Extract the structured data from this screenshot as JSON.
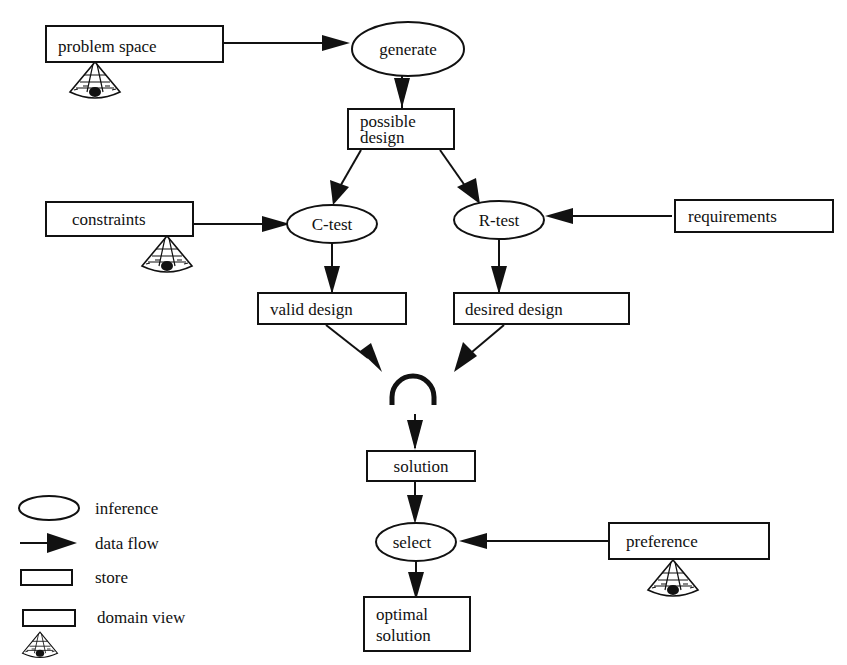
{
  "diagram": {
    "nodes": {
      "problem_space": {
        "label": "problem space",
        "type": "domain view"
      },
      "generate": {
        "label": "generate",
        "type": "inference"
      },
      "possible_design": {
        "line1": "possible",
        "line2": "design",
        "type": "store"
      },
      "constraints": {
        "label": "constraints",
        "type": "domain view"
      },
      "c_test": {
        "label": "C-test",
        "type": "inference"
      },
      "r_test": {
        "label": "R-test",
        "type": "inference"
      },
      "requirements": {
        "label": "requirements",
        "type": "store"
      },
      "valid_design": {
        "label": "valid design",
        "type": "store"
      },
      "desired_design": {
        "label": "desired design",
        "type": "store"
      },
      "intersection": {
        "symbol": "∩",
        "type": "operator"
      },
      "solution": {
        "label": "solution",
        "type": "store"
      },
      "select": {
        "label": "select",
        "type": "inference"
      },
      "preference": {
        "label": "preference",
        "type": "domain view"
      },
      "optimal_solution": {
        "line1": "optimal",
        "line2": "solution",
        "type": "store"
      }
    },
    "edges": [
      {
        "from": "problem space",
        "to": "generate"
      },
      {
        "from": "generate",
        "to": "possible design"
      },
      {
        "from": "possible design",
        "to": "C-test"
      },
      {
        "from": "possible design",
        "to": "R-test"
      },
      {
        "from": "constraints",
        "to": "C-test"
      },
      {
        "from": "requirements",
        "to": "R-test"
      },
      {
        "from": "C-test",
        "to": "valid design"
      },
      {
        "from": "R-test",
        "to": "desired design"
      },
      {
        "from": "valid design",
        "to": "intersection"
      },
      {
        "from": "desired design",
        "to": "intersection"
      },
      {
        "from": "intersection",
        "to": "solution"
      },
      {
        "from": "solution",
        "to": "select"
      },
      {
        "from": "preference",
        "to": "select"
      },
      {
        "from": "select",
        "to": "optimal solution"
      }
    ]
  },
  "legend": {
    "inference": "inference",
    "data_flow": "data flow",
    "store": "store",
    "domain_view": "domain view"
  },
  "colors": {
    "ink": "#111111",
    "background": "#ffffff"
  }
}
